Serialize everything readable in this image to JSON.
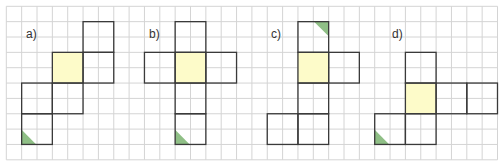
{
  "colors": {
    "grid_line": "#d4d4d4",
    "shape_outline": "#3a3a3a",
    "base_face": "#fdfbc9",
    "marker": "#8fbf86",
    "background": "#ffffff"
  },
  "grid": {
    "origin_x": 6.3,
    "origin_y": 6.3,
    "cell": 15.35,
    "cols": 32,
    "rows": 10
  },
  "panels": [
    {
      "label": "a)",
      "label_pos": [
        26,
        28
      ],
      "squares": [
        [
          5,
          1
        ],
        [
          5,
          3
        ],
        [
          3,
          3
        ],
        [
          1,
          5
        ],
        [
          3,
          5
        ],
        [
          1,
          7
        ]
      ],
      "base": [
        3,
        3
      ],
      "marker": {
        "square": [
          1,
          7
        ],
        "corner": "bottom-left"
      }
    },
    {
      "label": "b)",
      "label_pos": [
        149,
        28
      ],
      "squares": [
        [
          11,
          1
        ],
        [
          9,
          3
        ],
        [
          11,
          3
        ],
        [
          13,
          3
        ],
        [
          11,
          5
        ],
        [
          11,
          7
        ]
      ],
      "base": [
        11,
        3
      ],
      "marker": {
        "square": [
          11,
          7
        ],
        "corner": "bottom-left"
      }
    },
    {
      "label": "c)",
      "label_pos": [
        271,
        28
      ],
      "squares": [
        [
          19,
          1
        ],
        [
          19,
          3
        ],
        [
          21,
          3
        ],
        [
          19,
          5
        ],
        [
          17,
          7
        ],
        [
          19,
          7
        ]
      ],
      "base": [
        19,
        3
      ],
      "marker": {
        "square": [
          19,
          1
        ],
        "corner": "top-right"
      }
    },
    {
      "label": "d)",
      "label_pos": [
        392,
        28
      ],
      "squares": [
        [
          26,
          3
        ],
        [
          26,
          5
        ],
        [
          28,
          5
        ],
        [
          30,
          5
        ],
        [
          24,
          7
        ],
        [
          26,
          7
        ]
      ],
      "base": [
        26,
        5
      ],
      "marker": {
        "square": [
          24,
          7
        ],
        "corner": "bottom-left"
      }
    }
  ]
}
